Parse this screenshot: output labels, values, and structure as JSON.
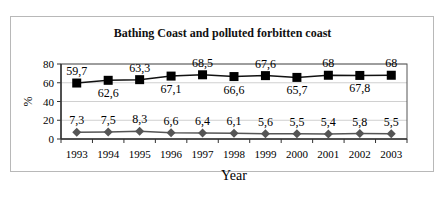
{
  "chart_data": {
    "type": "line",
    "title": "Bathing Coast and polluted forbitten coast",
    "xlabel": "Year",
    "ylabel": "%",
    "ylim": [
      0,
      80
    ],
    "yticks": [
      0,
      20,
      40,
      60,
      80
    ],
    "grid": true,
    "legend": "none",
    "categories": [
      "1993",
      "1994",
      "1995",
      "1996",
      "1997",
      "1998",
      "1999",
      "2000",
      "2001",
      "2002",
      "2003"
    ],
    "series": [
      {
        "name": "Bathing coast",
        "marker": "square",
        "color": "#000000",
        "values": [
          59.7,
          62.6,
          63.3,
          67.1,
          68.5,
          66.6,
          67.6,
          65.7,
          68,
          67.8,
          68
        ],
        "labels": [
          "59,7",
          "62,6",
          "63,3",
          "67,1",
          "68,5",
          "66,6",
          "67,6",
          "65,7",
          "68",
          "67,8",
          "68"
        ],
        "label_pos": [
          "above",
          "below",
          "above",
          "below",
          "above",
          "below",
          "above",
          "below",
          "above",
          "below",
          "above"
        ]
      },
      {
        "name": "Polluted forbidden coast",
        "marker": "diamond",
        "color": "#555555",
        "values": [
          7.3,
          7.5,
          8.3,
          6.6,
          6.4,
          6.1,
          5.6,
          5.5,
          5.4,
          5.8,
          5.5
        ],
        "labels": [
          "7,3",
          "7,5",
          "8,3",
          "6,6",
          "6,4",
          "6,1",
          "5,6",
          "5,5",
          "5,4",
          "5,8",
          "5,5"
        ],
        "label_pos": [
          "above",
          "above",
          "above",
          "above",
          "above",
          "above",
          "above",
          "above",
          "above",
          "above",
          "above"
        ]
      }
    ]
  }
}
